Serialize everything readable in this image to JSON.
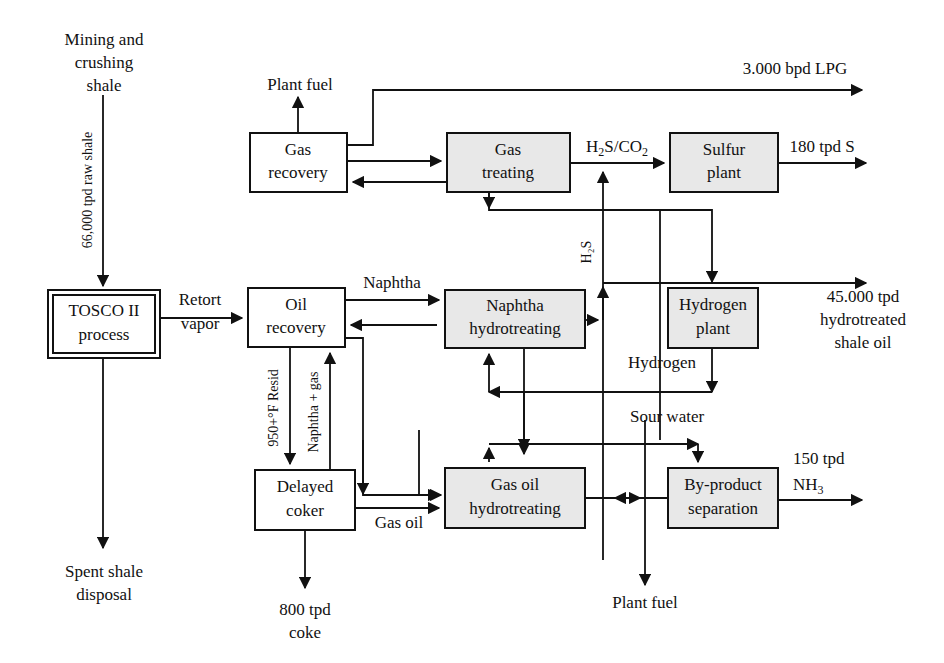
{
  "diagram": {
    "background_color": "#ffffff",
    "line_color": "#111111",
    "box_gray_fill": "#e8e8e8",
    "box_white_fill": "#ffffff"
  },
  "boxes": {
    "tosco": {
      "line1": "TOSCO II",
      "line2": "process"
    },
    "oil_recovery": {
      "line1": "Oil",
      "line2": "recovery"
    },
    "gas_recovery": {
      "line1": "Gas",
      "line2": "recovery"
    },
    "gas_treating": {
      "line1": "Gas",
      "line2": "treating"
    },
    "sulfur_plant": {
      "line1": "Sulfur",
      "line2": "plant"
    },
    "naphtha_hydrotreating": {
      "line1": "Naphtha",
      "line2": "hydrotreating"
    },
    "hydrogen_plant": {
      "line1": "Hydrogen",
      "line2": "plant"
    },
    "delayed_coker": {
      "line1": "Delayed",
      "line2": "coker"
    },
    "gas_oil_hydrotreating": {
      "line1": "Gas oil",
      "line2": "hydrotreating"
    },
    "byproduct_separation": {
      "line1": "By-product",
      "line2": "separation"
    }
  },
  "labels": {
    "mining_l1": "Mining and",
    "mining_l2": "crushing",
    "mining_l3": "shale",
    "raw_shale_feed": "66,000 tpd raw shale",
    "spent_shale_l1": "Spent shale",
    "spent_shale_l2": "disposal",
    "retort_l1": "Retort",
    "retort_l2": "vapor",
    "plant_fuel_top": "Plant fuel",
    "plant_fuel_bottom": "Plant fuel",
    "lpg_product": "3.000 bpd LPG",
    "h2s_co2": "H",
    "h2s_co2_sub1": "2",
    "h2s_co2_mid": "S/CO",
    "h2s_co2_sub2": "2",
    "sulfur_product": "180 tpd S",
    "naphtha": "Naphtha",
    "resid": "950+°F Resid",
    "naphtha_gas": "Naphtha + gas",
    "gas_oil": "Gas oil",
    "h2s_vertical": "H₂S",
    "hydrogen": "Hydrogen",
    "sour_water": "Sour water",
    "coke_l1": "800 tpd",
    "coke_l2": "coke",
    "shale_oil_l1": "45.000 tpd",
    "shale_oil_l2": "hydrotreated",
    "shale_oil_l3": "shale oil",
    "nh3_l1": "150 tpd",
    "nh3_l2": "NH",
    "nh3_sub": "3"
  }
}
